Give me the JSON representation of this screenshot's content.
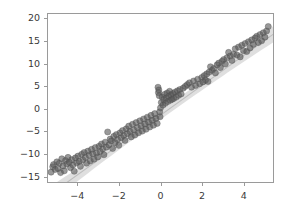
{
  "chart_data": {
    "type": "scatter",
    "title": "",
    "xlabel": "",
    "ylabel": "",
    "xlim": [
      -5.45,
      5.45
    ],
    "ylim": [
      -16.4,
      21.2
    ],
    "grid": false,
    "legend": null,
    "xticks": [
      -4,
      -2,
      0,
      2,
      4
    ],
    "xtick_labels": [
      "−4",
      "−2",
      "0",
      "2",
      "4"
    ],
    "yticks": [
      -15,
      -10,
      -5,
      0,
      5,
      10,
      15,
      20
    ],
    "ytick_labels": [
      "−15",
      "−10",
      "−5",
      "0",
      "5",
      "10",
      "15",
      "20"
    ],
    "marker": {
      "shape": "circle",
      "color": "#5a5a5a",
      "edge_color": "#4a4a4a",
      "opacity": 0.62,
      "size_px": 6.2
    },
    "regression": {
      "shown": true,
      "slope": 3.32,
      "intercept": -1.45,
      "line_color": "#bdbdbd",
      "band_color": "#d9d9d9",
      "band_opacity": 0.85,
      "band_half_width": 1.55,
      "band_label": "confidence-band"
    },
    "axes": {
      "spine_color": "#9a9a9a",
      "background": "#ffffff",
      "tick_color": "#9a9a9a",
      "tick_label_color": "#3a3a3a"
    },
    "n_points": 152,
    "points": [
      [
        -5.3,
        -14.2
      ],
      [
        -5.22,
        -13.0
      ],
      [
        -5.18,
        -12.5
      ],
      [
        -5.1,
        -13.6
      ],
      [
        -5.02,
        -11.9
      ],
      [
        -4.96,
        -13.4
      ],
      [
        -4.9,
        -12.2
      ],
      [
        -4.84,
        -14.3
      ],
      [
        -4.78,
        -11.2
      ],
      [
        -4.72,
        -12.8
      ],
      [
        -4.66,
        -13.9
      ],
      [
        -4.6,
        -11.6
      ],
      [
        -4.54,
        -12.4
      ],
      [
        -4.48,
        -10.9
      ],
      [
        -4.42,
        -12.0
      ],
      [
        -4.36,
        -13.2
      ],
      [
        -4.3,
        -11.4
      ],
      [
        -4.24,
        -12.6
      ],
      [
        -4.18,
        -14.0
      ],
      [
        -4.12,
        -11.0
      ],
      [
        -4.06,
        -12.1
      ],
      [
        -4.0,
        -10.6
      ],
      [
        -3.94,
        -11.8
      ],
      [
        -3.88,
        -12.9
      ],
      [
        -3.82,
        -10.2
      ],
      [
        -3.76,
        -11.5
      ],
      [
        -3.7,
        -9.8
      ],
      [
        -3.64,
        -10.9
      ],
      [
        -3.58,
        -12.2
      ],
      [
        -3.52,
        -9.5
      ],
      [
        -3.46,
        -10.4
      ],
      [
        -3.4,
        -11.7
      ],
      [
        -3.34,
        -9.1
      ],
      [
        -3.28,
        -10.1
      ],
      [
        -3.22,
        -11.3
      ],
      [
        -3.16,
        -8.7
      ],
      [
        -3.1,
        -9.9
      ],
      [
        -3.04,
        -10.8
      ],
      [
        -2.98,
        -8.4
      ],
      [
        -2.92,
        -9.6
      ],
      [
        -2.86,
        -7.9
      ],
      [
        -2.8,
        -9.0
      ],
      [
        -2.74,
        -10.3
      ],
      [
        -2.68,
        -7.5
      ],
      [
        -2.62,
        -8.6
      ],
      [
        -2.56,
        -5.2
      ],
      [
        -2.5,
        -8.1
      ],
      [
        -2.44,
        -6.8
      ],
      [
        -2.38,
        -7.2
      ],
      [
        -2.32,
        -8.9
      ],
      [
        -2.26,
        -6.2
      ],
      [
        -2.2,
        -7.6
      ],
      [
        -2.14,
        -5.8
      ],
      [
        -2.08,
        -6.9
      ],
      [
        -2.02,
        -8.2
      ],
      [
        -1.96,
        -5.4
      ],
      [
        -1.9,
        -6.5
      ],
      [
        -1.84,
        -4.9
      ],
      [
        -1.78,
        -6.0
      ],
      [
        -1.72,
        -7.1
      ],
      [
        -1.66,
        -4.5
      ],
      [
        -1.6,
        -5.6
      ],
      [
        -1.54,
        -3.9
      ],
      [
        -1.48,
        -5.1
      ],
      [
        -1.42,
        -6.3
      ],
      [
        -1.36,
        -3.5
      ],
      [
        -1.3,
        -4.7
      ],
      [
        -1.24,
        -5.9
      ],
      [
        -1.18,
        -3.1
      ],
      [
        -1.12,
        -4.2
      ],
      [
        -1.06,
        -5.4
      ],
      [
        -1.0,
        -2.7
      ],
      [
        -0.94,
        -3.8
      ],
      [
        -0.88,
        -5.0
      ],
      [
        -0.82,
        -2.3
      ],
      [
        -0.76,
        -3.4
      ],
      [
        -0.7,
        -4.6
      ],
      [
        -0.64,
        -1.9
      ],
      [
        -0.58,
        -3.0
      ],
      [
        -0.52,
        -4.1
      ],
      [
        -0.46,
        -1.5
      ],
      [
        -0.4,
        -2.6
      ],
      [
        -0.34,
        -3.7
      ],
      [
        -0.28,
        -1.1
      ],
      [
        -0.22,
        -2.2
      ],
      [
        -0.16,
        -3.3
      ],
      [
        -0.12,
        4.8
      ],
      [
        -0.1,
        3.6
      ],
      [
        -0.08,
        4.2
      ],
      [
        -0.06,
        2.9
      ],
      [
        -0.04,
        -0.7
      ],
      [
        -0.02,
        -1.8
      ],
      [
        0.0,
        0.2
      ],
      [
        0.04,
        1.4
      ],
      [
        0.08,
        2.6
      ],
      [
        0.12,
        0.8
      ],
      [
        0.16,
        2.0
      ],
      [
        0.2,
        3.2
      ],
      [
        0.24,
        1.2
      ],
      [
        0.28,
        2.4
      ],
      [
        0.32,
        3.5
      ],
      [
        0.36,
        1.6
      ],
      [
        0.4,
        2.8
      ],
      [
        0.44,
        3.9
      ],
      [
        0.48,
        1.9
      ],
      [
        0.52,
        3.1
      ],
      [
        0.56,
        2.1
      ],
      [
        0.6,
        3.4
      ],
      [
        0.64,
        2.3
      ],
      [
        0.7,
        3.7
      ],
      [
        0.76,
        2.6
      ],
      [
        0.82,
        4.0
      ],
      [
        0.88,
        3.0
      ],
      [
        0.94,
        4.3
      ],
      [
        1.0,
        3.3
      ],
      [
        1.1,
        4.6
      ],
      [
        1.2,
        5.0
      ],
      [
        1.3,
        5.4
      ],
      [
        1.4,
        5.8
      ],
      [
        1.5,
        4.8
      ],
      [
        1.6,
        6.2
      ],
      [
        1.7,
        5.2
      ],
      [
        1.8,
        6.6
      ],
      [
        1.9,
        5.6
      ],
      [
        2.0,
        7.0
      ],
      [
        2.06,
        6.0
      ],
      [
        2.12,
        7.4
      ],
      [
        2.18,
        6.4
      ],
      [
        2.24,
        7.8
      ],
      [
        2.3,
        6.1
      ],
      [
        2.36,
        8.2
      ],
      [
        2.42,
        9.4
      ],
      [
        2.5,
        8.6
      ],
      [
        2.58,
        9.0
      ],
      [
        2.66,
        8.0
      ],
      [
        2.74,
        9.8
      ],
      [
        2.82,
        10.2
      ],
      [
        2.9,
        9.2
      ],
      [
        2.98,
        10.6
      ],
      [
        3.06,
        11.0
      ],
      [
        3.14,
        10.0
      ],
      [
        3.22,
        11.4
      ],
      [
        3.3,
        12.6
      ],
      [
        3.38,
        11.8
      ],
      [
        3.46,
        10.8
      ],
      [
        3.54,
        12.2
      ],
      [
        3.62,
        13.4
      ],
      [
        3.7,
        12.0
      ],
      [
        3.78,
        13.8
      ],
      [
        3.86,
        11.6
      ],
      [
        3.94,
        14.2
      ],
      [
        4.02,
        13.0
      ],
      [
        4.1,
        14.6
      ],
      [
        4.18,
        12.8
      ],
      [
        4.26,
        15.0
      ],
      [
        4.34,
        13.6
      ],
      [
        4.42,
        15.4
      ],
      [
        4.5,
        14.4
      ],
      [
        4.58,
        15.8
      ],
      [
        4.66,
        16.2
      ],
      [
        4.74,
        14.8
      ],
      [
        4.82,
        16.6
      ],
      [
        4.9,
        15.2
      ],
      [
        4.98,
        17.0
      ],
      [
        5.06,
        16.0
      ],
      [
        5.14,
        17.4
      ],
      [
        5.22,
        18.4
      ]
    ]
  }
}
